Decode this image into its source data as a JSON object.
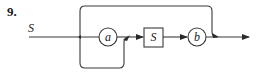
{
  "problem_number": "9.",
  "rule_name": "S",
  "nodes": [
    {
      "type": "nonterminal-or-terminal-circle",
      "label": "a"
    },
    {
      "type": "nonterminal-box",
      "label": "S"
    },
    {
      "type": "terminal-circle",
      "label": "b"
    }
  ],
  "colors": {
    "stroke": "#3a3a3a",
    "text": "#1a1a1a",
    "background": "#ffffff"
  }
}
